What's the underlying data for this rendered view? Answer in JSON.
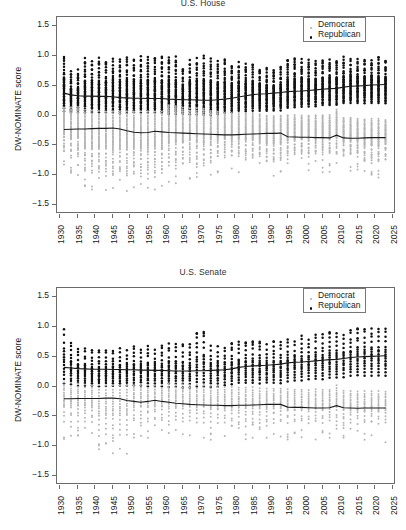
{
  "figure": {
    "width": 406,
    "height": 530,
    "background": "#ffffff"
  },
  "panels": [
    {
      "id": "house",
      "title": "",
      "title_note": "title cropped off top edge of screenshot"
    },
    {
      "id": "senate",
      "title": "U.S. Senate"
    }
  ],
  "legend": {
    "position": "top-right",
    "entries": [
      {
        "label": "Democrat",
        "color": "#b4b4b4",
        "marker": "small-dot"
      },
      {
        "label": "Republican",
        "color": "#111111",
        "marker": "dot"
      }
    ]
  },
  "axes": {
    "ylabel": "DW-NOMINATE score",
    "yticks": [
      "1.5",
      "1.0",
      "0.5",
      "0.0",
      "-0.5",
      "-1.0",
      "-1.5"
    ],
    "xticks": [
      "1930",
      "1935",
      "1940",
      "1945",
      "1950",
      "1955",
      "1960",
      "1965",
      "1970",
      "1975",
      "1980",
      "1985",
      "1990",
      "1995",
      "2000",
      "2005",
      "2010",
      "2015",
      "2020",
      "2025"
    ]
  },
  "chart_data": [
    {
      "type": "scatter",
      "title": "U.S. House",
      "xlabel": "",
      "ylabel": "DW-NOMINATE score",
      "xlim": [
        1929,
        2026
      ],
      "ylim": [
        -1.65,
        1.65
      ],
      "grid": false,
      "legend_position": "upper right",
      "x": [
        1931,
        1933,
        1935,
        1937,
        1939,
        1941,
        1943,
        1945,
        1947,
        1949,
        1951,
        1953,
        1955,
        1957,
        1959,
        1961,
        1963,
        1965,
        1967,
        1969,
        1971,
        1973,
        1975,
        1977,
        1979,
        1981,
        1983,
        1985,
        1987,
        1989,
        1991,
        1993,
        1995,
        1997,
        1999,
        2001,
        2003,
        2005,
        2007,
        2009,
        2011,
        2013,
        2015,
        2017,
        2019,
        2021,
        2023
      ],
      "series": [
        {
          "name": "Republican",
          "color": "#111111",
          "kind": "median-line-with-points",
          "median": [
            0.375,
            0.345,
            0.33,
            0.325,
            0.325,
            0.32,
            0.32,
            0.315,
            0.3,
            0.295,
            0.29,
            0.29,
            0.285,
            0.285,
            0.285,
            0.275,
            0.27,
            0.265,
            0.265,
            0.26,
            0.255,
            0.255,
            0.265,
            0.275,
            0.29,
            0.31,
            0.33,
            0.35,
            0.36,
            0.365,
            0.375,
            0.385,
            0.4,
            0.405,
            0.41,
            0.42,
            0.43,
            0.44,
            0.45,
            0.455,
            0.475,
            0.49,
            0.495,
            0.5,
            0.51,
            0.515,
            0.52
          ],
          "spread_low": [
            0.05,
            0.02,
            0.03,
            0.03,
            0.02,
            0.02,
            0.02,
            0.02,
            0.01,
            0.02,
            0.02,
            0.02,
            0.02,
            0.02,
            0.01,
            0.0,
            0.0,
            0.0,
            0.0,
            -0.01,
            -0.02,
            -0.02,
            0.0,
            0.02,
            0.03,
            0.05,
            0.04,
            0.06,
            0.06,
            0.06,
            0.07,
            0.07,
            0.1,
            0.12,
            0.12,
            0.13,
            0.14,
            0.15,
            0.15,
            0.15,
            0.18,
            0.19,
            0.19,
            0.19,
            0.19,
            0.19,
            0.18
          ],
          "spread_high": [
            1.0,
            0.72,
            0.73,
            0.93,
            0.93,
            0.93,
            0.93,
            0.95,
            0.95,
            0.96,
            0.96,
            0.96,
            0.96,
            0.96,
            0.96,
            0.96,
            0.96,
            0.8,
            0.93,
            0.96,
            0.96,
            0.96,
            0.88,
            0.9,
            0.86,
            0.9,
            0.88,
            0.88,
            0.8,
            0.8,
            0.75,
            0.8,
            0.92,
            0.92,
            0.92,
            0.92,
            0.92,
            0.92,
            0.92,
            0.95,
            0.95,
            0.95,
            0.95,
            0.95,
            0.95,
            0.95,
            0.95
          ]
        },
        {
          "name": "Democrat",
          "color": "#b4b4b4",
          "kind": "median-line-with-points",
          "median": [
            -0.235,
            -0.23,
            -0.225,
            -0.225,
            -0.22,
            -0.215,
            -0.215,
            -0.21,
            -0.225,
            -0.255,
            -0.28,
            -0.29,
            -0.285,
            -0.265,
            -0.275,
            -0.285,
            -0.29,
            -0.295,
            -0.3,
            -0.305,
            -0.31,
            -0.315,
            -0.32,
            -0.325,
            -0.325,
            -0.32,
            -0.315,
            -0.31,
            -0.305,
            -0.3,
            -0.3,
            -0.295,
            -0.355,
            -0.36,
            -0.365,
            -0.365,
            -0.37,
            -0.37,
            -0.375,
            -0.33,
            -0.375,
            -0.38,
            -0.38,
            -0.375,
            -0.37,
            -0.37,
            -0.37
          ],
          "spread_low": [
            -0.62,
            -0.7,
            -0.7,
            -0.96,
            -0.96,
            -0.96,
            -0.96,
            -0.98,
            -0.98,
            -0.98,
            -0.98,
            -0.98,
            -0.98,
            -0.98,
            -0.98,
            -0.86,
            -0.84,
            -0.84,
            -0.78,
            -0.84,
            -0.84,
            -0.72,
            -0.72,
            -0.7,
            -0.7,
            -0.7,
            -0.7,
            -0.7,
            -0.7,
            -0.78,
            -0.78,
            -0.78,
            -0.68,
            -0.66,
            -0.66,
            -0.66,
            -0.66,
            -0.66,
            -0.66,
            -0.66,
            -0.68,
            -0.68,
            -0.68,
            -0.8,
            -0.8,
            -0.8,
            -0.68
          ],
          "spread_high": [
            0.16,
            0.16,
            0.16,
            0.12,
            0.1,
            0.1,
            0.1,
            0.1,
            0.1,
            0.1,
            0.1,
            0.1,
            0.1,
            0.1,
            0.1,
            0.2,
            0.18,
            0.16,
            0.14,
            0.14,
            0.14,
            0.1,
            0.08,
            0.06,
            0.06,
            0.06,
            0.06,
            0.06,
            0.04,
            0.02,
            0.02,
            0.02,
            0.02,
            0.02,
            0.02,
            0.02,
            0.02,
            0.02,
            0.02,
            0.12,
            -0.02,
            -0.02,
            -0.04,
            -0.04,
            -0.04,
            -0.04,
            -0.06
          ]
        }
      ]
    },
    {
      "type": "scatter",
      "title": "U.S. Senate",
      "xlabel": "",
      "ylabel": "DW-NOMINATE score",
      "xlim": [
        1929,
        2026
      ],
      "ylim": [
        -1.65,
        1.65
      ],
      "grid": false,
      "legend_position": "upper right",
      "x": [
        1931,
        1933,
        1935,
        1937,
        1939,
        1941,
        1943,
        1945,
        1947,
        1949,
        1951,
        1953,
        1955,
        1957,
        1959,
        1961,
        1963,
        1965,
        1967,
        1969,
        1971,
        1973,
        1975,
        1977,
        1979,
        1981,
        1983,
        1985,
        1987,
        1989,
        1991,
        1993,
        1995,
        1997,
        1999,
        2001,
        2003,
        2005,
        2007,
        2009,
        2011,
        2013,
        2015,
        2017,
        2019,
        2021,
        2023
      ],
      "series": [
        {
          "name": "Republican",
          "color": "#111111",
          "kind": "median-line-with-points",
          "median": [
            0.32,
            0.31,
            0.3,
            0.295,
            0.29,
            0.29,
            0.29,
            0.285,
            0.285,
            0.28,
            0.28,
            0.275,
            0.275,
            0.27,
            0.27,
            0.265,
            0.26,
            0.26,
            0.26,
            0.265,
            0.265,
            0.27,
            0.275,
            0.28,
            0.295,
            0.32,
            0.335,
            0.345,
            0.35,
            0.355,
            0.365,
            0.375,
            0.395,
            0.405,
            0.41,
            0.42,
            0.43,
            0.44,
            0.45,
            0.455,
            0.47,
            0.485,
            0.495,
            0.5,
            0.505,
            0.51,
            0.515
          ],
          "spread_low": [
            0.0,
            0.0,
            -0.02,
            -0.02,
            -0.02,
            -0.02,
            -0.02,
            -0.02,
            -0.02,
            -0.02,
            -0.02,
            -0.02,
            -0.03,
            -0.03,
            -0.04,
            -0.05,
            -0.05,
            -0.05,
            -0.05,
            -0.05,
            -0.05,
            -0.05,
            -0.04,
            -0.02,
            0.0,
            0.02,
            0.02,
            0.02,
            0.02,
            0.02,
            0.02,
            0.02,
            0.05,
            0.06,
            0.06,
            0.08,
            0.08,
            0.08,
            0.1,
            0.1,
            0.12,
            0.14,
            0.14,
            0.14,
            0.14,
            0.14,
            0.14
          ],
          "spread_high": [
            1.0,
            0.72,
            0.62,
            0.62,
            0.58,
            0.58,
            0.58,
            0.58,
            0.6,
            0.62,
            0.66,
            0.66,
            0.66,
            0.66,
            0.68,
            0.7,
            0.7,
            0.7,
            0.7,
            0.88,
            0.88,
            0.72,
            0.7,
            0.7,
            0.7,
            0.72,
            0.72,
            0.72,
            0.72,
            0.72,
            0.72,
            0.72,
            0.78,
            0.8,
            0.82,
            0.82,
            0.85,
            0.85,
            0.88,
            0.88,
            0.9,
            0.92,
            0.95,
            0.95,
            0.95,
            0.95,
            0.95
          ]
        },
        {
          "name": "Democrat",
          "color": "#b4b4b4",
          "kind": "median-line-with-points",
          "median": [
            -0.205,
            -0.205,
            -0.2,
            -0.2,
            -0.2,
            -0.2,
            -0.195,
            -0.195,
            -0.205,
            -0.235,
            -0.25,
            -0.265,
            -0.25,
            -0.23,
            -0.25,
            -0.265,
            -0.28,
            -0.29,
            -0.3,
            -0.305,
            -0.31,
            -0.315,
            -0.315,
            -0.32,
            -0.32,
            -0.315,
            -0.315,
            -0.31,
            -0.305,
            -0.3,
            -0.3,
            -0.3,
            -0.345,
            -0.35,
            -0.35,
            -0.355,
            -0.36,
            -0.36,
            -0.355,
            -0.32,
            -0.355,
            -0.36,
            -0.365,
            -0.36,
            -0.36,
            -0.36,
            -0.36
          ],
          "spread_low": [
            -0.6,
            -0.6,
            -0.6,
            -0.62,
            -0.62,
            -0.85,
            -0.85,
            -0.85,
            -0.85,
            -0.85,
            -0.62,
            -0.62,
            -0.62,
            -0.6,
            -0.6,
            -0.6,
            -0.6,
            -0.6,
            -0.6,
            -0.62,
            -0.62,
            -0.62,
            -0.62,
            -0.62,
            -0.62,
            -0.62,
            -0.62,
            -0.62,
            -0.62,
            -0.62,
            -0.62,
            -0.62,
            -0.62,
            -0.62,
            -0.62,
            -0.62,
            -0.62,
            -0.62,
            -0.62,
            -0.62,
            -0.64,
            -0.64,
            -0.64,
            -0.64,
            -0.64,
            -0.64,
            -0.64
          ],
          "spread_high": [
            0.1,
            0.1,
            0.08,
            0.06,
            0.06,
            0.06,
            0.06,
            0.06,
            0.06,
            0.06,
            0.06,
            0.06,
            0.06,
            0.06,
            0.06,
            0.08,
            0.06,
            0.06,
            0.06,
            0.06,
            0.06,
            0.04,
            0.02,
            0.02,
            0.02,
            0.02,
            0.02,
            0.02,
            0.0,
            0.0,
            0.0,
            0.0,
            -0.02,
            -0.02,
            -0.02,
            -0.02,
            -0.02,
            -0.02,
            -0.02,
            0.06,
            -0.04,
            -0.04,
            -0.05,
            -0.05,
            -0.05,
            -0.05,
            -0.05
          ]
        }
      ]
    }
  ]
}
